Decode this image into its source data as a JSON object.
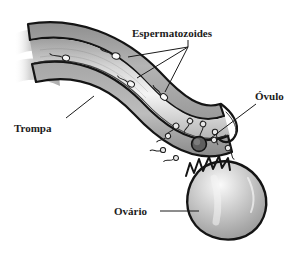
{
  "figure": {
    "language": "pt-BR",
    "background_color": "#ffffff",
    "ink_color": "#1a1a1a",
    "tissue_fill": "#b9b9b9",
    "tissue_light": "#f2f2f2",
    "ovary_fill": "#b5b5b5"
  },
  "labels": {
    "sperm": "Espermatozoides",
    "ovum": "Óvulo",
    "tube": "Trompa",
    "ovary": "Ovário"
  },
  "structures": [
    {
      "id": "tube",
      "label": "Trompa",
      "description": "tuba uterina em corte"
    },
    {
      "id": "ovum",
      "label": "Óvulo",
      "description": "ovócito liberado"
    },
    {
      "id": "ovary",
      "label": "Ovário",
      "description": "ovário com folículo rompido"
    },
    {
      "id": "sperm",
      "label": "Espermatozoides",
      "description": "espermatozoides nadando"
    }
  ],
  "counts": {
    "sperm_in_tube": 4,
    "sperm_near_ovum": 8,
    "leader_lines_sperm": 3
  }
}
